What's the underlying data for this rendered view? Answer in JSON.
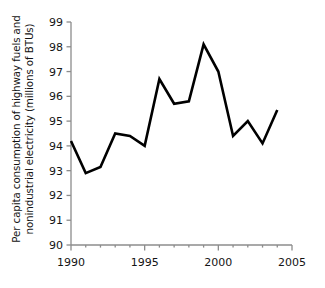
{
  "chart_data": {
    "type": "line",
    "title": "",
    "xlabel": "",
    "ylabel": "Per capita consumption of highway fuels and\nnonindustrial electricity (millions of BTUs)",
    "x": [
      1990,
      1991,
      1992,
      1993,
      1994,
      1995,
      1996,
      1997,
      1998,
      1999,
      2000,
      2001,
      2002,
      2003,
      2004
    ],
    "values": [
      94.2,
      92.9,
      93.15,
      94.5,
      94.4,
      94.0,
      96.7,
      95.7,
      95.8,
      98.1,
      97.0,
      94.4,
      95.0,
      94.1,
      95.45
    ],
    "series": [
      {
        "name": "Per capita consumption",
        "values": [
          94.2,
          92.9,
          93.15,
          94.5,
          94.4,
          94.0,
          96.7,
          95.7,
          95.8,
          98.1,
          97.0,
          94.4,
          95.0,
          94.1,
          95.45
        ]
      }
    ],
    "xlim": [
      1990,
      2005
    ],
    "ylim": [
      90,
      99
    ],
    "ytick_values": [
      90,
      91,
      92,
      93,
      94,
      95,
      96,
      97,
      98,
      99
    ],
    "ytick_labels": [
      "90",
      "91",
      "92",
      "93",
      "94",
      "95",
      "96",
      "97",
      "98",
      "99"
    ],
    "xtick_values": [
      1990,
      1995,
      2000,
      2005
    ],
    "xtick_labels": [
      "1990",
      "1995",
      "2000",
      "2005"
    ],
    "xminor_step": 1,
    "grid": false,
    "legend": null,
    "line_color": "#000000",
    "axis_color": "#8c8c8c",
    "background_color": "#ffffff",
    "line_width": 2.6
  }
}
